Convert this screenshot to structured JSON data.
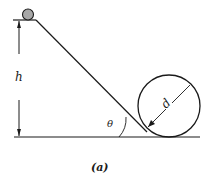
{
  "diagram": {
    "caption": "(a)",
    "labels": {
      "height": "h",
      "angle": "θ",
      "diameter": "d"
    },
    "colors": {
      "line": "#1a1a1a",
      "ball_fill": "#a8a8a8",
      "background": "#ffffff"
    }
  }
}
